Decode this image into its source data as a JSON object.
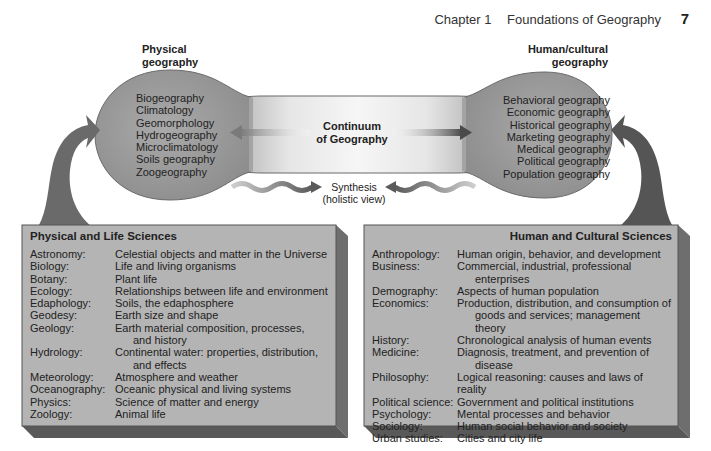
{
  "header": {
    "chapter": "Chapter 1",
    "title": "Foundations of Geography",
    "page_number": "7"
  },
  "continuum": {
    "left_heading": [
      "Physical",
      "geography"
    ],
    "right_heading": [
      "Human/cultural",
      "geography"
    ],
    "center_label": [
      "Continuum",
      "of Geography"
    ],
    "synthesis_label": [
      "Synthesis",
      "(holistic view)"
    ],
    "physical_fields": [
      "Biogeography",
      "Climatology",
      "Geomorphology",
      "Hydrogeography",
      "Microclimatology",
      "Soils geography",
      "Zoogeography"
    ],
    "human_fields": [
      "Behavioral geography",
      "Economic geography",
      "Historical geography",
      "Marketing geography",
      "Medical geography",
      "Political geography",
      "Population geography"
    ]
  },
  "physical_box": {
    "title": "Physical and Life Sciences",
    "rows": [
      {
        "term": "Astronomy:",
        "def": "Celestial objects and matter in the Universe",
        "cont": ""
      },
      {
        "term": "Biology:",
        "def": "Life and living organisms",
        "cont": ""
      },
      {
        "term": "Botany:",
        "def": "Plant life",
        "cont": ""
      },
      {
        "term": "Ecology:",
        "def": "Relationships between life and environment",
        "cont": ""
      },
      {
        "term": "Edaphology:",
        "def": "Soils, the edaphosphere",
        "cont": ""
      },
      {
        "term": "Geodesy:",
        "def": "Earth size and shape",
        "cont": ""
      },
      {
        "term": "Geology:",
        "def": "Earth material composition, processes,",
        "cont": "and history"
      },
      {
        "term": "Hydrology:",
        "def": "Continental water: properties, distribution,",
        "cont": "and effects"
      },
      {
        "term": "Meteorology:",
        "def": "Atmosphere and weather",
        "cont": ""
      },
      {
        "term": "Oceanography:",
        "def": "Oceanic physical and living systems",
        "cont": ""
      },
      {
        "term": "Physics:",
        "def": "Science of matter and energy",
        "cont": ""
      },
      {
        "term": "Zoology:",
        "def": "Animal life",
        "cont": ""
      }
    ]
  },
  "human_box": {
    "title": "Human and Cultural Sciences",
    "rows": [
      {
        "term": "Anthropology:",
        "def": "Human origin, behavior, and development",
        "cont": ""
      },
      {
        "term": "Business:",
        "def": "Commercial, industrial, professional",
        "cont": "enterprises"
      },
      {
        "term": "Demography:",
        "def": "Aspects of human population",
        "cont": ""
      },
      {
        "term": "Economics:",
        "def": "Production, distribution, and consumption of",
        "cont": "goods and services; management theory"
      },
      {
        "term": "History:",
        "def": "Chronological analysis of human events",
        "cont": ""
      },
      {
        "term": "Medicine:",
        "def": "Diagnosis, treatment, and prevention of",
        "cont": "disease"
      },
      {
        "term": "Philosophy:",
        "def": "Logical reasoning: causes and laws of reality",
        "cont": ""
      },
      {
        "term": "Political science:",
        "def": "Government and political institutions",
        "cont": ""
      },
      {
        "term": "Psychology:",
        "def": "Mental processes and behavior",
        "cont": ""
      },
      {
        "term": "Sociology:",
        "def": "Human social behavior and society",
        "cont": ""
      },
      {
        "term": "Urban studies:",
        "def": "Cities and city life",
        "cont": ""
      }
    ]
  },
  "colors": {
    "bulb": "#9a9a9a",
    "neck_light": "#f2f2f2",
    "box_face": "#b3b3b3",
    "box_side": "#6e6e6e",
    "box_bottom": "#5a5a5a",
    "arrow": "#5e5e5e"
  }
}
